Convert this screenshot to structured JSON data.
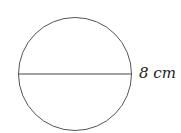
{
  "figure": {
    "shape": "circle",
    "diameter_label": "8 cm",
    "stroke_color": "#555555"
  }
}
